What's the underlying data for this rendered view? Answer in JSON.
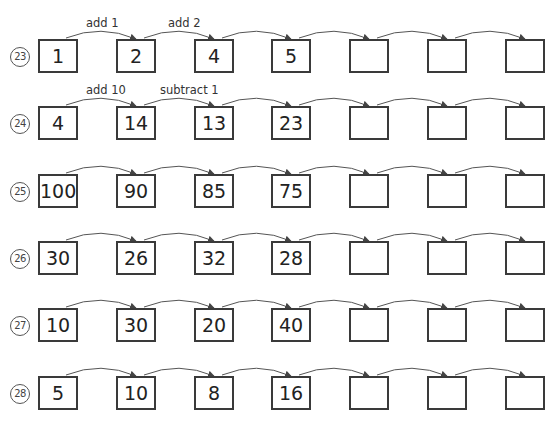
{
  "worksheet": {
    "rows": [
      {
        "number": "23",
        "boxes": [
          "1",
          "2",
          "4",
          "5",
          "",
          "",
          ""
        ],
        "labels": [
          "add 1",
          "add 2"
        ]
      },
      {
        "number": "24",
        "boxes": [
          "4",
          "14",
          "13",
          "23",
          "",
          "",
          ""
        ],
        "labels": [
          "add 10",
          "subtract 1"
        ]
      },
      {
        "number": "25",
        "boxes": [
          "100",
          "90",
          "85",
          "75",
          "",
          "",
          ""
        ],
        "labels": []
      },
      {
        "number": "26",
        "boxes": [
          "30",
          "26",
          "32",
          "28",
          "",
          "",
          ""
        ],
        "labels": []
      },
      {
        "number": "27",
        "boxes": [
          "10",
          "30",
          "20",
          "40",
          "",
          "",
          ""
        ],
        "labels": []
      },
      {
        "number": "28",
        "boxes": [
          "5",
          "10",
          "8",
          "16",
          "",
          "",
          ""
        ],
        "labels": []
      }
    ]
  }
}
